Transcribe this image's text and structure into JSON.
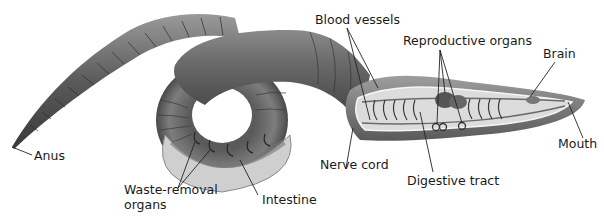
{
  "diagram": {
    "labels": {
      "anus": "Anus",
      "waste_removal_line1": "Waste-removal",
      "waste_removal_line2": "organs",
      "intestine": "Intestine",
      "nerve_cord": "Nerve cord",
      "blood_vessels": "Blood vessels",
      "reproductive_organs": "Reproductive organs",
      "digestive_tract": "Digestive tract",
      "brain": "Brain",
      "mouth": "Mouth"
    },
    "colors": {
      "body_dark": "#4a4a4a",
      "body_mid": "#7a7a7a",
      "body_light": "#b5b5b5",
      "interior": "#cfcfcf",
      "leader_line": "#222222"
    }
  }
}
